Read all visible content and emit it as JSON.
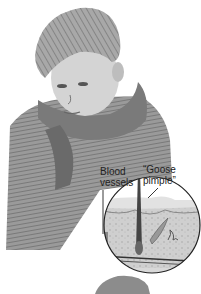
{
  "illustration": {
    "subject": "boy-with-scarf-shivering",
    "inset": {
      "shape": "circle",
      "content": "skin-cross-section",
      "labels": {
        "blood_vessels": "Blood\nvessels",
        "blood_line1": "Blood",
        "blood_line2": "vessels",
        "goose_line1": "“Goose",
        "goose_line2": "pimple”"
      }
    },
    "colors": {
      "background": "#ffffff",
      "ink": "#222222",
      "sketch_mid": "#8a8a8a",
      "sketch_light": "#c8c8c8",
      "skin_layer": "#d6d6d6"
    }
  }
}
